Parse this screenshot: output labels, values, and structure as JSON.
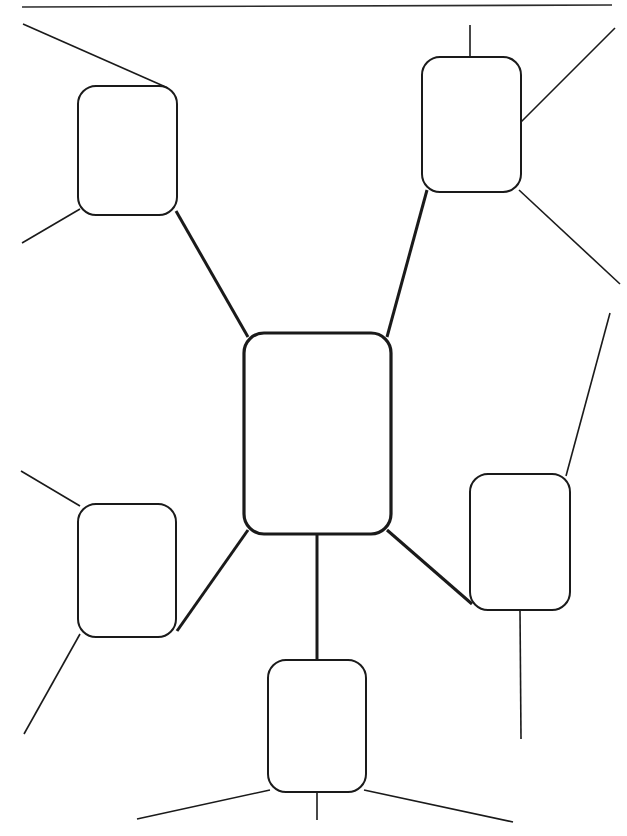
{
  "page": {
    "width": 627,
    "height": 836,
    "background_color": "#ffffff",
    "ink_color": "#1a1a1a"
  },
  "header_rule": {
    "name": "top-horizontal-rule",
    "x1": 22,
    "y1": 7,
    "x2": 612,
    "y2": 5,
    "stroke_width": 1.6,
    "color": "#2b2b2b"
  },
  "diagram": {
    "type": "mind-map",
    "state": "blank",
    "central_node": {
      "id": "central",
      "label": "",
      "x": 244,
      "y": 333,
      "width": 147,
      "height": 201,
      "radius": 20,
      "stroke_width": 3.2
    },
    "branch_nodes": [
      {
        "id": "top-left",
        "label": "",
        "position": "top-left",
        "x": 78,
        "y": 86,
        "width": 99,
        "height": 129,
        "radius": 18,
        "stroke_width": 2.0
      },
      {
        "id": "top-right",
        "label": "",
        "position": "top-right",
        "x": 422,
        "y": 57,
        "width": 99,
        "height": 135,
        "radius": 18,
        "stroke_width": 2.0
      },
      {
        "id": "left",
        "label": "",
        "position": "left",
        "x": 78,
        "y": 504,
        "width": 98,
        "height": 133,
        "radius": 18,
        "stroke_width": 2.0
      },
      {
        "id": "right",
        "label": "",
        "position": "right",
        "x": 470,
        "y": 474,
        "width": 100,
        "height": 136,
        "radius": 18,
        "stroke_width": 2.0
      },
      {
        "id": "bottom",
        "label": "",
        "position": "bottom",
        "x": 268,
        "y": 660,
        "width": 98,
        "height": 132,
        "radius": 18,
        "stroke_width": 2.0
      }
    ],
    "primary_connectors": [
      {
        "id": "central-to-top-left",
        "from": "central",
        "to": "top-left",
        "x1": 248,
        "y1": 337,
        "x2": 176,
        "y2": 211,
        "stroke_width": 3.0
      },
      {
        "id": "central-to-top-right",
        "from": "central",
        "to": "top-right",
        "x1": 387,
        "y1": 337,
        "x2": 427,
        "y2": 190,
        "stroke_width": 3.0
      },
      {
        "id": "central-to-left",
        "from": "central",
        "to": "left",
        "x1": 248,
        "y1": 530,
        "x2": 177,
        "y2": 631,
        "stroke_width": 3.0
      },
      {
        "id": "central-to-right",
        "from": "central",
        "to": "right",
        "x1": 387,
        "y1": 530,
        "x2": 472,
        "y2": 604,
        "stroke_width": 3.0
      },
      {
        "id": "central-to-bottom",
        "from": "central",
        "to": "bottom",
        "x1": 317,
        "y1": 534,
        "x2": 317,
        "y2": 660,
        "stroke_width": 3.0
      }
    ],
    "leaf_lines": [
      {
        "id": "leaf-top-left-up",
        "parent": "top-left",
        "x1": 168,
        "y1": 88,
        "x2": 23,
        "y2": 24,
        "stroke_width": 1.6
      },
      {
        "id": "leaf-top-left-down",
        "parent": "top-left",
        "x1": 80,
        "y1": 209,
        "x2": 22,
        "y2": 243,
        "stroke_width": 1.6
      },
      {
        "id": "leaf-top-right-up",
        "parent": "top-right",
        "x1": 470,
        "y1": 57,
        "x2": 470,
        "y2": 25,
        "stroke_width": 1.6
      },
      {
        "id": "leaf-top-right-ne",
        "parent": "top-right",
        "x1": 520,
        "y1": 123,
        "x2": 615,
        "y2": 28,
        "stroke_width": 1.6
      },
      {
        "id": "leaf-top-right-se",
        "parent": "top-right",
        "x1": 519,
        "y1": 190,
        "x2": 620,
        "y2": 284,
        "stroke_width": 1.6
      },
      {
        "id": "leaf-left-up",
        "parent": "left",
        "x1": 80,
        "y1": 506,
        "x2": 21,
        "y2": 471,
        "stroke_width": 1.6
      },
      {
        "id": "leaf-left-down",
        "parent": "left",
        "x1": 80,
        "y1": 634,
        "x2": 24,
        "y2": 734,
        "stroke_width": 1.6
      },
      {
        "id": "leaf-right-ne",
        "parent": "right",
        "x1": 566,
        "y1": 476,
        "x2": 610,
        "y2": 313,
        "stroke_width": 1.6
      },
      {
        "id": "leaf-right-down",
        "parent": "right",
        "x1": 520,
        "y1": 610,
        "x2": 521,
        "y2": 739,
        "stroke_width": 1.6
      },
      {
        "id": "leaf-bottom-sw",
        "parent": "bottom",
        "x1": 270,
        "y1": 790,
        "x2": 137,
        "y2": 819,
        "stroke_width": 1.6
      },
      {
        "id": "leaf-bottom-down",
        "parent": "bottom",
        "x1": 317,
        "y1": 792,
        "x2": 317,
        "y2": 820,
        "stroke_width": 1.6
      },
      {
        "id": "leaf-bottom-se",
        "parent": "bottom",
        "x1": 364,
        "y1": 790,
        "x2": 513,
        "y2": 822,
        "stroke_width": 1.6
      }
    ]
  }
}
